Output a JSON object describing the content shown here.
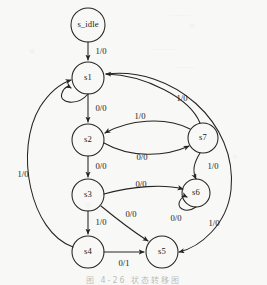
{
  "figure": {
    "caption": "图 4-26   状态转移图",
    "background_color": "#f8f8f6",
    "ink_color": "#262420"
  },
  "nodes": [
    {
      "id": "s_idle",
      "label": "s_idle",
      "cx": 88,
      "cy": 25,
      "r": 17
    },
    {
      "id": "s1",
      "label": "s1",
      "cx": 88,
      "cy": 78,
      "r": 16
    },
    {
      "id": "s2",
      "label": "s2",
      "cx": 88,
      "cy": 140,
      "r": 16
    },
    {
      "id": "s3",
      "label": "s3",
      "cx": 88,
      "cy": 195,
      "r": 16
    },
    {
      "id": "s4",
      "label": "s4",
      "cx": 88,
      "cy": 252,
      "r": 16
    },
    {
      "id": "s5",
      "label": "s5",
      "cx": 162,
      "cy": 252,
      "r": 16
    },
    {
      "id": "s6",
      "label": "s6",
      "cx": 196,
      "cy": 193,
      "r": 14
    },
    {
      "id": "s7",
      "label": "s7",
      "cx": 203,
      "cy": 138,
      "r": 15
    }
  ],
  "edges": [
    {
      "id": "e-idle-s1",
      "from": "s_idle",
      "to": "s1",
      "label": "1/0",
      "path": "M 88 42 L 88 60",
      "label_x": 101,
      "label_y": 52,
      "arrow": true
    },
    {
      "id": "e-s1-self",
      "from": "s1",
      "to": "s1",
      "label": "",
      "path": "M 88 94 C 78 106, 58 104, 62 93 C 64 87, 68 86, 71 88",
      "label_x": 0,
      "label_y": 0,
      "arrow": true
    },
    {
      "id": "e-s1-s2",
      "from": "s1",
      "to": "s2",
      "label": "0/0",
      "path": "M 88 94 L 88 122",
      "label_x": 101,
      "label_y": 109,
      "arrow": true
    },
    {
      "id": "e-s2-s7",
      "from": "s2",
      "to": "s7",
      "label": "0/0",
      "path": "M 104 143 C 130 158, 165 157, 189 146",
      "label_x": 142,
      "label_y": 158,
      "arrow": true
    },
    {
      "id": "e-s7-s2",
      "from": "s7",
      "to": "s2",
      "label": "1/0",
      "path": "M 190 129 C 165 116, 128 120, 105 133",
      "label_x": 140,
      "label_y": 117,
      "arrow": true
    },
    {
      "id": "e-s7-s1",
      "from": "s7",
      "to": "s1",
      "label": "1/0",
      "path": "M 200 123 C 190 98, 145 75, 106 74",
      "label_x": 182,
      "label_y": 99,
      "arrow": true
    },
    {
      "id": "e-s7-s6",
      "from": "s7",
      "to": "s6",
      "label": "1/0",
      "path": "M 200 153 C 194 163, 192 170, 196 179",
      "label_x": 213,
      "label_y": 167,
      "arrow": true
    },
    {
      "id": "e-s2-s3",
      "from": "s2",
      "to": "s3",
      "label": "0/0",
      "path": "M 88 156 L 88 177",
      "label_x": 101,
      "label_y": 167,
      "arrow": true
    },
    {
      "id": "e-s3-s6",
      "from": "s3",
      "to": "s6",
      "label": "0/0",
      "path": "M 104 194 C 133 186, 164 184, 183 189",
      "label_x": 141,
      "label_y": 185,
      "arrow": true
    },
    {
      "id": "e-s6-self",
      "from": "s6",
      "to": "s6",
      "label": "0/0",
      "path": "M 196 207 C 186 214, 174 208, 181 199 C 183 196, 185 196, 187 197",
      "label_x": 176,
      "label_y": 219,
      "arrow": true
    },
    {
      "id": "e-s3-s5",
      "from": "s3",
      "to": "s5",
      "label": "0/0",
      "path": "M 101 206 C 118 220, 134 232, 148 241",
      "label_x": 131,
      "label_y": 215,
      "arrow": true
    },
    {
      "id": "e-s3-s4",
      "from": "s3",
      "to": "s4",
      "label": "1/0",
      "path": "M 88 211 L 88 234",
      "label_x": 101,
      "label_y": 223,
      "arrow": true
    },
    {
      "id": "e-s4-s5",
      "from": "s4",
      "to": "s5",
      "label": "0/1",
      "path": "M 104 252 L 144 252",
      "label_x": 124,
      "label_y": 264,
      "arrow": true
    },
    {
      "id": "e-s4-s1",
      "from": "s4",
      "to": "s1",
      "label": "1/0",
      "path": "M 73 247 C 30 232, 14 150, 40 107 C 51 90, 62 83, 71 80",
      "label_x": 23,
      "label_y": 175,
      "arrow": true
    },
    {
      "id": "e-s1-s5",
      "from": "s1",
      "to": "s5",
      "label": "1/0",
      "path": "M 106 74 C 172 66, 238 122, 231 190 C 227 225, 200 247, 179 252",
      "label_x": 214,
      "label_y": 224,
      "arrow": true
    }
  ],
  "bleed_through": [
    {
      "text": "............",
      "x": 170,
      "y": 10
    },
    {
      "text": "..............",
      "x": 150,
      "y": 44
    },
    {
      "text": "............",
      "x": 175,
      "y": 62
    }
  ]
}
